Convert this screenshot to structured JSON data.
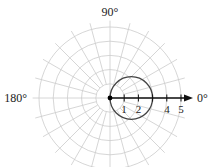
{
  "chart_data": {
    "type": "polar",
    "title": "",
    "angle_labels": [
      {
        "angle_deg": 90,
        "text": "90°"
      },
      {
        "angle_deg": 180,
        "text": "180°"
      },
      {
        "angle_deg": 0,
        "text": "0°"
      }
    ],
    "radial_tick_labels": [
      "1",
      "2",
      "4",
      "5"
    ],
    "radial_ticks": [
      1,
      2,
      3,
      4,
      5
    ],
    "grid": {
      "rings": [
        1,
        2,
        3,
        4,
        5
      ],
      "spoke_step_deg": 15,
      "color": "#cccccc"
    },
    "polar_axis": {
      "direction_deg": 0,
      "arrow": true,
      "color": "#111111"
    },
    "curve": {
      "description": "circle through the pole, r = 3 cos(theta)",
      "equation": "r = 3cos(θ)",
      "center_r": 1.5,
      "center_theta_deg": 0,
      "radius": 1.5,
      "color": "#444444"
    },
    "pole_point": {
      "r": 0,
      "color": "#000000"
    },
    "rmax": 5
  }
}
